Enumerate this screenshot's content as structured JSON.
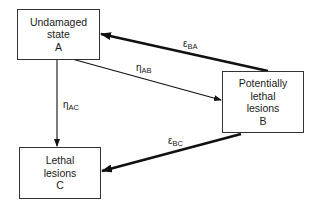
{
  "diagram": {
    "nodes": [
      {
        "id": "A",
        "lines": [
          "Undamaged",
          "state",
          "A"
        ]
      },
      {
        "id": "B",
        "lines": [
          "Potentially",
          "lethal",
          "lesions",
          "B"
        ]
      },
      {
        "id": "C",
        "lines": [
          "Lethal",
          "lesions",
          "C"
        ]
      }
    ],
    "edges": [
      {
        "from": "A",
        "to": "B",
        "symbol": "η",
        "subscript": "AB",
        "weight": "thin"
      },
      {
        "from": "A",
        "to": "C",
        "symbol": "η",
        "subscript": "AC",
        "weight": "thin"
      },
      {
        "from": "B",
        "to": "A",
        "symbol": "ε",
        "subscript": "BA",
        "weight": "thick"
      },
      {
        "from": "B",
        "to": "C",
        "symbol": "ε",
        "subscript": "BC",
        "weight": "thick"
      }
    ]
  }
}
